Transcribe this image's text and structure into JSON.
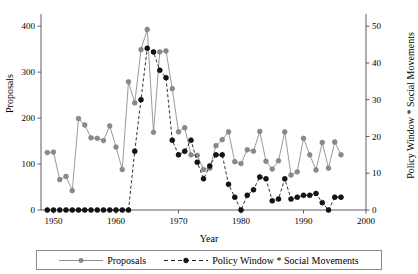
{
  "chart_data": {
    "type": "line",
    "title": "",
    "xlabel": "Year",
    "ylabel": "Proposals",
    "y2label": "Policy Window * Social Movements",
    "xlim": [
      1948,
      2000
    ],
    "ylim": [
      0,
      420
    ],
    "y2lim": [
      0,
      52.5
    ],
    "xticks": [
      1950,
      1960,
      1970,
      1980,
      1990,
      2000
    ],
    "yticks": [
      0,
      100,
      200,
      300,
      400
    ],
    "y2ticks": [
      0,
      10,
      20,
      30,
      40,
      50
    ],
    "grid": false,
    "legend_position": "bottom",
    "x": [
      1949,
      1950,
      1951,
      1952,
      1953,
      1954,
      1955,
      1956,
      1957,
      1958,
      1959,
      1960,
      1961,
      1962,
      1963,
      1964,
      1965,
      1966,
      1967,
      1968,
      1969,
      1970,
      1971,
      1972,
      1973,
      1974,
      1975,
      1976,
      1977,
      1978,
      1979,
      1980,
      1981,
      1982,
      1983,
      1984,
      1985,
      1986,
      1987,
      1988,
      1989,
      1990,
      1991,
      1992,
      1993,
      1994,
      1995,
      1996
    ],
    "series": [
      {
        "name": "Proposals",
        "axis": "left",
        "color": "#8a8a8a",
        "marker": "circle",
        "linestyle": "solid",
        "values": [
          125,
          126,
          66,
          73,
          42,
          199,
          185,
          157,
          156,
          151,
          183,
          137,
          88,
          279,
          233,
          349,
          393,
          169,
          344,
          346,
          264,
          170,
          179,
          120,
          119,
          88,
          91,
          140,
          153,
          170,
          105,
          101,
          131,
          128,
          171,
          106,
          89,
          107,
          170,
          76,
          83,
          156,
          120,
          87,
          147,
          91,
          148,
          120
        ]
      },
      {
        "name": "Policy Window * Social Movements",
        "axis": "right",
        "color": "#141414",
        "marker": "circle",
        "linestyle": "dashed",
        "values": [
          0,
          0,
          0,
          0,
          0,
          0,
          0,
          0,
          0,
          0,
          0,
          0,
          0,
          0,
          16,
          30,
          44,
          43,
          38,
          36,
          19,
          15,
          16,
          19,
          13,
          8.5,
          12,
          15,
          15,
          7,
          3.5,
          0,
          4,
          5.5,
          9,
          8.5,
          2.5,
          3,
          8.5,
          3,
          3.5,
          4,
          4,
          4.5,
          2,
          0,
          3.5,
          3.5
        ]
      }
    ]
  },
  "legend": {
    "entries": [
      {
        "label": "Proposals"
      },
      {
        "label": "Policy Window * Social Movements"
      }
    ]
  }
}
